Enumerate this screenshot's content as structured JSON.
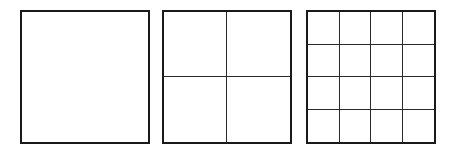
{
  "diagram": {
    "line_color": "#1a1a1a",
    "squares": [
      {
        "divisions": 1,
        "cells": 1
      },
      {
        "divisions": 2,
        "cells": 4
      },
      {
        "divisions": 4,
        "cells": 16
      }
    ]
  }
}
